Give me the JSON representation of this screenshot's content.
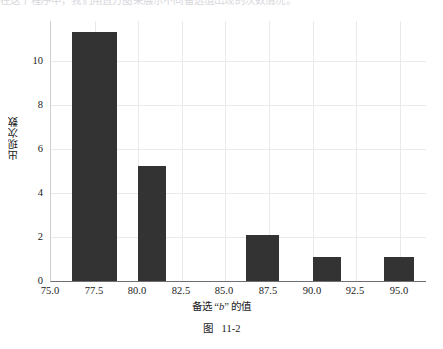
{
  "page": {
    "top_cut_text": "在这个程序中，我们用直方图来展示不同备选值出现的次数情况。",
    "caption_prefix": "图",
    "caption_number": "11-2"
  },
  "chart_data": {
    "type": "bar",
    "title": "",
    "xlabel": "备选 “b” 的值",
    "ylabel": "出现次数",
    "xlim": [
      75.0,
      96.5
    ],
    "ylim": [
      0,
      11.8
    ],
    "grid": true,
    "legend": "none",
    "bar_color": "#333333",
    "xticks": [
      "75.0",
      "77.5",
      "80.0",
      "82.5",
      "85.0",
      "87.5",
      "90.0",
      "92.5",
      "95.0"
    ],
    "xtick_values": [
      75.0,
      77.5,
      80.0,
      82.5,
      85.0,
      87.5,
      90.0,
      92.5,
      95.0
    ],
    "yticks": [
      "0",
      "2",
      "4",
      "6",
      "8",
      "10"
    ],
    "ytick_values": [
      0,
      2,
      4,
      6,
      8,
      10
    ],
    "bars": [
      {
        "x_start": 76.2,
        "x_end": 78.8,
        "center": 77.5,
        "value": 11.3
      },
      {
        "x_start": 80.0,
        "x_end": 81.6,
        "center": 80.8,
        "value": 5.2
      },
      {
        "x_start": 86.2,
        "x_end": 88.1,
        "center": 87.1,
        "value": 2.1
      },
      {
        "x_start": 90.0,
        "x_end": 91.6,
        "center": 90.8,
        "value": 1.1
      },
      {
        "x_start": 94.1,
        "x_end": 95.8,
        "center": 95.0,
        "value": 1.1
      }
    ],
    "categories": [
      "77.5",
      "80.8",
      "87.1",
      "90.8",
      "95.0"
    ],
    "values": [
      11.3,
      5.2,
      2.1,
      1.1,
      1.1
    ]
  }
}
